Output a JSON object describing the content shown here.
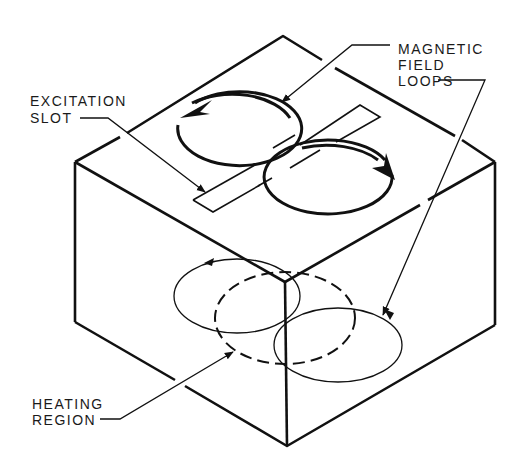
{
  "diagram": {
    "type": "isometric-block-illustration",
    "labels": {
      "magnetic_field_loops": [
        "MAGNETIC",
        "FIELD",
        "LOOPS"
      ],
      "excitation_slot": [
        "EXCITATION",
        "SLOT"
      ],
      "heating_region": [
        "HEATING",
        "REGION"
      ]
    },
    "colors": {
      "line": "#111111",
      "background": "#ffffff"
    }
  }
}
